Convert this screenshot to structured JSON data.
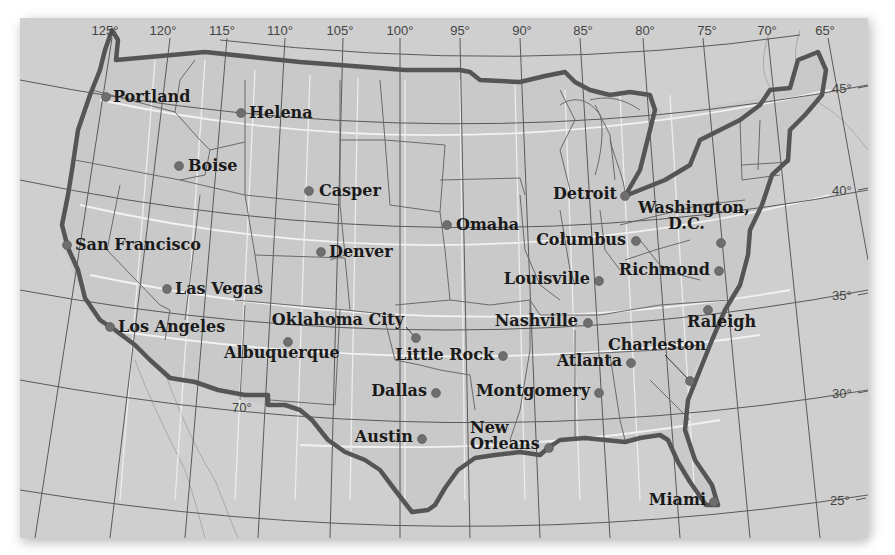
{
  "map": {
    "title": "Contiguous United States — major cities",
    "colors": {
      "background": "#cfcfcf",
      "land": "#c9c9c9",
      "national_border": "#555555",
      "state_lines": "#6a6a6a",
      "graticule": "#555555",
      "white_parallels": "#f2f2f2",
      "city_dot": "#6e6e6e",
      "label_text": "#1a1a1a"
    },
    "longitude_labels": [
      {
        "label": "125°",
        "x": 105,
        "y": 35
      },
      {
        "label": "120°",
        "x": 163,
        "y": 35
      },
      {
        "label": "115°",
        "x": 222,
        "y": 35
      },
      {
        "label": "110°",
        "x": 280,
        "y": 35
      },
      {
        "label": "105°",
        "x": 340,
        "y": 35
      },
      {
        "label": "100°",
        "x": 400,
        "y": 35
      },
      {
        "label": "95°",
        "x": 460,
        "y": 35
      },
      {
        "label": "90°",
        "x": 522,
        "y": 35
      },
      {
        "label": "85°",
        "x": 583,
        "y": 35
      },
      {
        "label": "80°",
        "x": 645,
        "y": 35
      },
      {
        "label": "75°",
        "x": 707,
        "y": 35
      },
      {
        "label": "70°",
        "x": 767,
        "y": 35
      },
      {
        "label": "65°",
        "x": 825,
        "y": 35
      }
    ],
    "latitude_labels": [
      {
        "label": "45°",
        "x": 832,
        "y": 93
      },
      {
        "label": "40°",
        "x": 832,
        "y": 195
      },
      {
        "label": "35°",
        "x": 832,
        "y": 300
      },
      {
        "label": "30°",
        "x": 832,
        "y": 398
      },
      {
        "label": "25°",
        "x": 830,
        "y": 505
      }
    ],
    "interior_label": {
      "label": "70°",
      "x": 232,
      "y": 412
    },
    "cities": [
      {
        "name": "Portland",
        "dot_x": 106,
        "dot_y": 97,
        "label_x": 113,
        "label_y": 102,
        "anchor": "start"
      },
      {
        "name": "Helena",
        "dot_x": 241,
        "dot_y": 113,
        "label_x": 249,
        "label_y": 118,
        "anchor": "start"
      },
      {
        "name": "Boise",
        "dot_x": 179,
        "dot_y": 166,
        "label_x": 188,
        "label_y": 171,
        "anchor": "start"
      },
      {
        "name": "Casper",
        "dot_x": 309,
        "dot_y": 191,
        "label_x": 319,
        "label_y": 196,
        "anchor": "start"
      },
      {
        "name": "San Francisco",
        "dot_x": 67,
        "dot_y": 245,
        "label_x": 75,
        "label_y": 250,
        "anchor": "start"
      },
      {
        "name": "Denver",
        "dot_x": 321,
        "dot_y": 252,
        "label_x": 329,
        "label_y": 257,
        "anchor": "start"
      },
      {
        "name": "Las Vegas",
        "dot_x": 167,
        "dot_y": 289,
        "label_x": 175,
        "label_y": 294,
        "anchor": "start"
      },
      {
        "name": "Los Angeles",
        "dot_x": 110,
        "dot_y": 327,
        "label_x": 118,
        "label_y": 332,
        "anchor": "start"
      },
      {
        "name": "Oklahoma City",
        "dot_x": 416,
        "dot_y": 338,
        "label_x": 404,
        "label_y": 325,
        "anchor": "end",
        "leader": true
      },
      {
        "name": "Albuquerque",
        "dot_x": 288,
        "dot_y": 342,
        "label_x": 224,
        "label_y": 358,
        "anchor": "start"
      },
      {
        "name": "Omaha",
        "dot_x": 447,
        "dot_y": 225,
        "label_x": 456,
        "label_y": 230,
        "anchor": "start"
      },
      {
        "name": "Little Rock",
        "dot_x": 503,
        "dot_y": 356,
        "label_x": 494,
        "label_y": 360,
        "anchor": "end"
      },
      {
        "name": "Dallas",
        "dot_x": 436,
        "dot_y": 393,
        "label_x": 427,
        "label_y": 396,
        "anchor": "end"
      },
      {
        "name": "Austin",
        "dot_x": 422,
        "dot_y": 439,
        "label_x": 413,
        "label_y": 442,
        "anchor": "end"
      },
      {
        "name": "New Orleans",
        "line1": "New",
        "line2": "Orleans",
        "dot_x": 549,
        "dot_y": 448,
        "label_x": 470,
        "label_y": 433,
        "anchor": "start"
      },
      {
        "name": "Detroit",
        "dot_x": 625,
        "dot_y": 196,
        "label_x": 617,
        "label_y": 199,
        "anchor": "end"
      },
      {
        "name": "Columbus",
        "dot_x": 636,
        "dot_y": 241,
        "label_x": 626,
        "label_y": 245,
        "anchor": "end"
      },
      {
        "name": "Louisville",
        "dot_x": 599,
        "dot_y": 281,
        "label_x": 590,
        "label_y": 284,
        "anchor": "end"
      },
      {
        "name": "Nashville",
        "dot_x": 588,
        "dot_y": 323,
        "label_x": 578,
        "label_y": 326,
        "anchor": "end"
      },
      {
        "name": "Atlanta",
        "dot_x": 631,
        "dot_y": 363,
        "label_x": 622,
        "label_y": 366,
        "anchor": "end"
      },
      {
        "name": "Montgomery",
        "dot_x": 599,
        "dot_y": 393,
        "label_x": 590,
        "label_y": 396,
        "anchor": "end"
      },
      {
        "name": "Washington, D.C.",
        "line1": "Washington,",
        "line2": "D.C.",
        "dot_x": 721,
        "dot_y": 243,
        "label_x": 638,
        "label_y": 213,
        "anchor": "start"
      },
      {
        "name": "Richmond",
        "dot_x": 719,
        "dot_y": 271,
        "label_x": 710,
        "label_y": 275,
        "anchor": "end"
      },
      {
        "name": "Raleigh",
        "dot_x": 708,
        "dot_y": 310,
        "label_x": 687,
        "label_y": 327,
        "anchor": "start"
      },
      {
        "name": "Charleston",
        "dot_x": 690,
        "dot_y": 381,
        "label_x": 608,
        "label_y": 350,
        "anchor": "start",
        "leader": true
      },
      {
        "name": "Miami",
        "dot_x": 714,
        "dot_y": 502,
        "label_x": 706,
        "label_y": 505,
        "anchor": "end"
      }
    ]
  }
}
